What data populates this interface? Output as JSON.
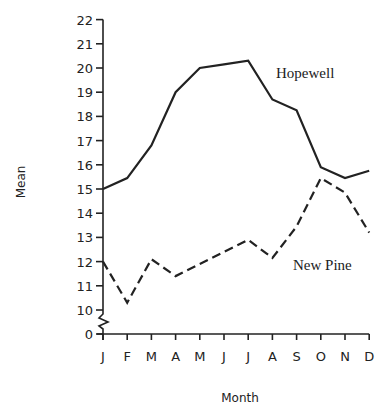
{
  "chart_data": {
    "type": "line",
    "title": "",
    "xlabel": "Month",
    "ylabel": "Mean",
    "categories": [
      "J",
      "F",
      "M",
      "A",
      "M",
      "J",
      "J",
      "A",
      "S",
      "O",
      "N",
      "D"
    ],
    "y_ticks": [
      0,
      10,
      11,
      12,
      13,
      14,
      15,
      16,
      17,
      18,
      19,
      20,
      21,
      22
    ],
    "ylim": [
      10,
      22
    ],
    "y_axis_break": "between 0 and 10",
    "grid": false,
    "legend": "inline labels near lines",
    "series": [
      {
        "name": "Hopewell",
        "style": "solid",
        "values": [
          15.0,
          15.45,
          16.8,
          19.0,
          20.0,
          20.15,
          20.3,
          18.7,
          18.25,
          15.9,
          15.45,
          15.75
        ]
      },
      {
        "name": "New Pine",
        "style": "dashed",
        "values": [
          12.0,
          10.3,
          12.1,
          11.4,
          11.9,
          12.4,
          12.9,
          12.15,
          13.45,
          15.45,
          14.85,
          13.2
        ]
      }
    ],
    "annotations": [
      {
        "text": "Hopewell",
        "x": 276,
        "y": 78
      },
      {
        "text": "New Pine",
        "x": 293,
        "y": 270
      }
    ]
  },
  "layout": {
    "x_axis_label": "Month",
    "y_axis_label": "Mean"
  }
}
